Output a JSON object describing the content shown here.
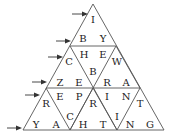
{
  "puzzle": {
    "type": "triangular word puzzle",
    "letters": [
      {
        "id": "l1",
        "char": "I"
      },
      {
        "id": "l2",
        "char": "B"
      },
      {
        "id": "l3",
        "char": "Y"
      },
      {
        "id": "l4",
        "char": "C"
      },
      {
        "id": "l5",
        "char": "H"
      },
      {
        "id": "l6",
        "char": "E"
      },
      {
        "id": "l7",
        "char": "W"
      },
      {
        "id": "l8",
        "char": "B"
      },
      {
        "id": "l9",
        "char": "Z"
      },
      {
        "id": "l10",
        "char": "E"
      },
      {
        "id": "l11",
        "char": "R"
      },
      {
        "id": "l12",
        "char": "A"
      },
      {
        "id": "l13",
        "char": "R"
      },
      {
        "id": "l14",
        "char": "E"
      },
      {
        "id": "l15",
        "char": "P"
      },
      {
        "id": "l16",
        "char": "R"
      },
      {
        "id": "l17",
        "char": "I"
      },
      {
        "id": "l18",
        "char": "N"
      },
      {
        "id": "l19",
        "char": "T"
      },
      {
        "id": "l20",
        "char": "Y"
      },
      {
        "id": "l21",
        "char": "A"
      },
      {
        "id": "l22",
        "char": "C"
      },
      {
        "id": "l23",
        "char": "H"
      },
      {
        "id": "l24",
        "char": "T"
      },
      {
        "id": "l25",
        "char": "I"
      },
      {
        "id": "l26",
        "char": "N"
      },
      {
        "id": "l27",
        "char": "G"
      }
    ],
    "arrow_count": 6,
    "icons": {
      "arrow": "right-arrow-icon"
    }
  }
}
